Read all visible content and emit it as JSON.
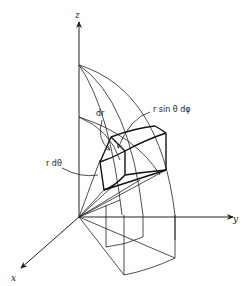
{
  "diagram": {
    "type": "spherical-volume-element",
    "axes": {
      "z": {
        "label": "z"
      },
      "y": {
        "label": "y"
      },
      "x": {
        "label": "x"
      }
    },
    "labels": {
      "dr": "dr",
      "r_sin_theta_dphi": "r sin θ dφ",
      "r_dtheta": "r dθ"
    },
    "colors": {
      "line": "#222222",
      "background": "#ffffff"
    }
  }
}
